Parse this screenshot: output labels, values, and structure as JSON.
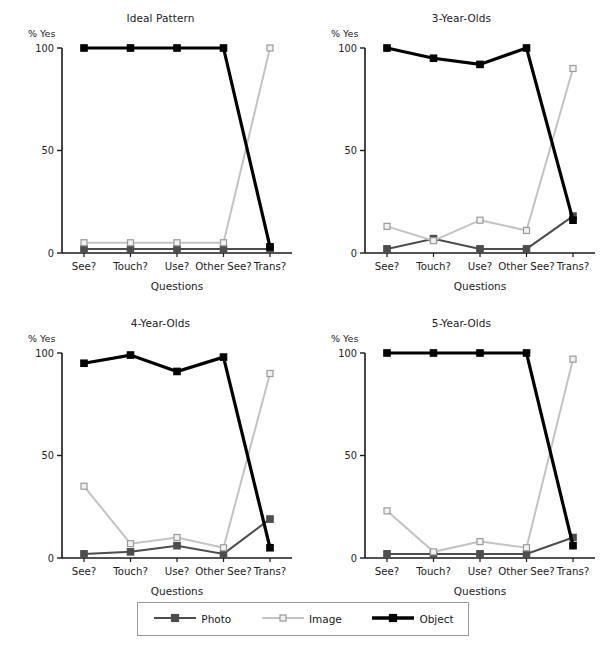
{
  "figure": {
    "background": "#ffffff",
    "legend": {
      "items": [
        {
          "name": "Photo",
          "color": "#4d4d4d",
          "marker": "filled-square",
          "linewidth": 2.2
        },
        {
          "name": "Image",
          "color": "#c3c3c3",
          "marker": "open-square",
          "linewidth": 2.2
        },
        {
          "name": "Object",
          "color": "#000000",
          "marker": "filled-square",
          "linewidth": 3.4
        }
      ],
      "position": "bottom-center",
      "border_color": "#9a9a9a"
    }
  },
  "chart_data": [
    {
      "type": "line",
      "title": "Ideal Pattern",
      "xlabel": "Questions",
      "ylabel": "% Yes",
      "categories": [
        "See?",
        "Touch?",
        "Use?",
        "Other See?",
        "Trans?"
      ],
      "ylim": [
        0,
        100
      ],
      "yticks": [
        0,
        50,
        100
      ],
      "yticklabels": [
        "0",
        "50",
        "100"
      ],
      "grid": false,
      "series": [
        {
          "name": "Photo",
          "color": "#4d4d4d",
          "marker": "filled-square",
          "values": [
            2,
            2,
            2,
            2,
            2
          ]
        },
        {
          "name": "Image",
          "color": "#c3c3c3",
          "marker": "open-square",
          "values": [
            5,
            5,
            5,
            5,
            100
          ]
        },
        {
          "name": "Object",
          "color": "#000000",
          "marker": "filled-square",
          "values": [
            100,
            100,
            100,
            100,
            3
          ]
        }
      ]
    },
    {
      "type": "line",
      "title": "3-Year-Olds",
      "xlabel": "Questions",
      "ylabel": "% Yes",
      "categories": [
        "See?",
        "Touch?",
        "Use?",
        "Other See?",
        "Trans?"
      ],
      "ylim": [
        0,
        100
      ],
      "yticks": [
        0,
        50,
        100
      ],
      "yticklabels": [
        "0",
        "50",
        "100"
      ],
      "grid": false,
      "series": [
        {
          "name": "Photo",
          "color": "#4d4d4d",
          "marker": "filled-square",
          "values": [
            2,
            7,
            2,
            2,
            18
          ]
        },
        {
          "name": "Image",
          "color": "#c3c3c3",
          "marker": "open-square",
          "values": [
            13,
            6,
            16,
            11,
            90
          ]
        },
        {
          "name": "Object",
          "color": "#000000",
          "marker": "filled-square",
          "values": [
            100,
            95,
            92,
            100,
            16
          ]
        }
      ]
    },
    {
      "type": "line",
      "title": "4-Year-Olds",
      "xlabel": "Questions",
      "ylabel": "% Yes",
      "categories": [
        "See?",
        "Touch?",
        "Use?",
        "Other See?",
        "Trans?"
      ],
      "ylim": [
        0,
        100
      ],
      "yticks": [
        0,
        50,
        100
      ],
      "yticklabels": [
        "0",
        "50",
        "100"
      ],
      "grid": false,
      "series": [
        {
          "name": "Photo",
          "color": "#4d4d4d",
          "marker": "filled-square",
          "values": [
            2,
            3,
            6,
            2,
            19
          ]
        },
        {
          "name": "Image",
          "color": "#c3c3c3",
          "marker": "open-square",
          "values": [
            35,
            7,
            10,
            5,
            90
          ]
        },
        {
          "name": "Object",
          "color": "#000000",
          "marker": "filled-square",
          "values": [
            95,
            99,
            91,
            98,
            5
          ]
        }
      ]
    },
    {
      "type": "line",
      "title": "5-Year-Olds",
      "xlabel": "Questions",
      "ylabel": "% Yes",
      "categories": [
        "See?",
        "Touch?",
        "Use?",
        "Other See?",
        "Trans?"
      ],
      "ylim": [
        0,
        100
      ],
      "yticks": [
        0,
        50,
        100
      ],
      "yticklabels": [
        "0",
        "50",
        "100"
      ],
      "grid": false,
      "series": [
        {
          "name": "Photo",
          "color": "#4d4d4d",
          "marker": "filled-square",
          "values": [
            2,
            2,
            2,
            2,
            10
          ]
        },
        {
          "name": "Image",
          "color": "#c3c3c3",
          "marker": "open-square",
          "values": [
            23,
            3,
            8,
            5,
            97
          ]
        },
        {
          "name": "Object",
          "color": "#000000",
          "marker": "filled-square",
          "values": [
            100,
            100,
            100,
            100,
            6
          ]
        }
      ]
    }
  ]
}
